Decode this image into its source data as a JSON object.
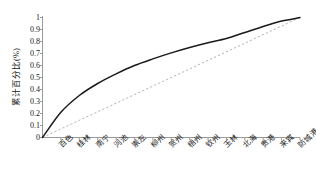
{
  "chart_data": {
    "type": "line",
    "title": "",
    "subtitle": "",
    "xlabel": "",
    "ylabel": "累计百分比(%)",
    "xlim": [
      0,
      14
    ],
    "ylim": [
      0,
      1
    ],
    "grid": false,
    "legend": null,
    "categories": [
      "百色",
      "桂林",
      "南宁",
      "河池",
      "崇左",
      "柳州",
      "贺州",
      "梧州",
      "钦州",
      "玉林",
      "北海",
      "贵港",
      "来宾",
      "防城港"
    ],
    "yticks": [
      "0",
      "0.1",
      "0.2",
      "0.3",
      "0.4",
      "0.5",
      "0.6",
      "0.7",
      "0.8",
      "0.9",
      "1"
    ],
    "ytick_values": [
      0,
      0.1,
      0.2,
      0.3,
      0.4,
      0.5,
      0.6,
      0.7,
      0.8,
      0.9,
      1
    ],
    "series": [
      {
        "name": "累计百分比",
        "style": "solid",
        "color": "#1a1a1a",
        "x": [
          0,
          1,
          2,
          3,
          4,
          5,
          6,
          7,
          8,
          9,
          10,
          11,
          12,
          13,
          14
        ],
        "values": [
          0.0,
          0.21,
          0.35,
          0.45,
          0.53,
          0.6,
          0.655,
          0.705,
          0.75,
          0.79,
          0.825,
          0.875,
          0.925,
          0.97,
          1.0
        ]
      },
      {
        "name": "均等参考线",
        "style": "dashed",
        "color": "#b4b4b4",
        "x": [
          0,
          14
        ],
        "values": [
          0.0,
          1.0
        ]
      }
    ],
    "annotations": []
  },
  "axes": {
    "axis_color": "#999999",
    "tick_color": "#999999",
    "text_color": "#1a1a1a",
    "background": "#ffffff"
  }
}
